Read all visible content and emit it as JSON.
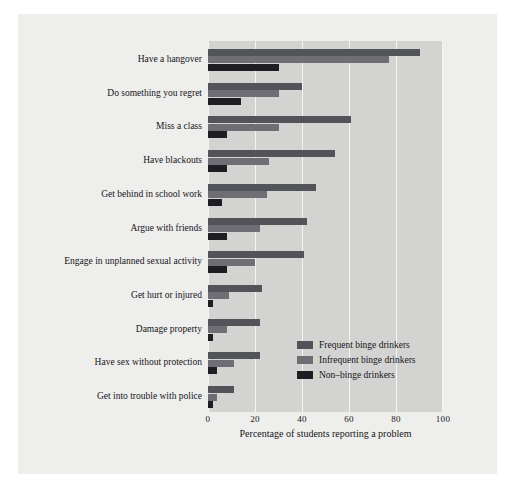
{
  "chart_data": {
    "type": "bar",
    "orientation": "horizontal",
    "title": "",
    "subtitle": "",
    "xlabel": "Percentage of students reporting a problem",
    "ylabel": "",
    "xlim": [
      0,
      100
    ],
    "xticks": [
      0,
      20,
      40,
      60,
      80,
      100
    ],
    "xticklabels": [
      "0",
      "20",
      "40",
      "60",
      "80",
      "100"
    ],
    "grid": true,
    "grid_axis": "x",
    "legend_position": "lower-right-inside",
    "categories": [
      "Have a hangover",
      "Do something you regret",
      "Miss a class",
      "Have blackouts",
      "Get behind in school work",
      "Argue with friends",
      "Engage in unplanned sexual activity",
      "Get hurt or injured",
      "Damage property",
      "Have sex without protection",
      "Get into trouble with police"
    ],
    "series": [
      {
        "name": "Frequent binge drinkers",
        "color": "#53535a",
        "values": [
          90,
          40,
          61,
          54,
          46,
          42,
          41,
          23,
          22,
          22,
          11
        ]
      },
      {
        "name": "Infrequent binge drinkers",
        "color": "#6e6e74",
        "values": [
          77,
          30,
          30,
          26,
          25,
          22,
          20,
          9,
          8,
          11,
          4
        ]
      },
      {
        "name": "Non–binge drinkers",
        "color": "#1e1e22",
        "values": [
          30,
          14,
          8,
          8,
          6,
          8,
          8,
          2,
          2,
          4,
          2
        ]
      }
    ]
  },
  "colors": {
    "figure_background": "#ffffff",
    "panel_background": "#eeeeec",
    "plot_background": "#d3d3d1",
    "gridline": "#f4f4f2",
    "text": "#15151a"
  }
}
